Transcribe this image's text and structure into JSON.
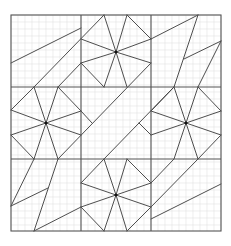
{
  "diagram": {
    "type": "geometric-tessellation-on-grid-paper",
    "frame": {
      "x": 11,
      "y": 15,
      "width": 210,
      "height": 216
    },
    "blocks": {
      "cols": 3,
      "rows": 3,
      "col_lines": [
        81,
        151
      ],
      "row_lines": [
        87,
        159
      ]
    },
    "grid": {
      "minor_step": 7,
      "minor_color": "#e3e3e3",
      "major_color": "#555555",
      "line_color": "#3a3a3a"
    },
    "star_centers": [
      {
        "x": 116,
        "y": 52
      },
      {
        "x": 46,
        "y": 123
      },
      {
        "x": 186,
        "y": 123
      },
      {
        "x": 116,
        "y": 195
      }
    ],
    "segments": [
      [
        11,
        63,
        81,
        28
      ],
      [
        34,
        87,
        104,
        15
      ],
      [
        58,
        87,
        81,
        63
      ],
      [
        81,
        39,
        116,
        52
      ],
      [
        116,
        52,
        151,
        39
      ],
      [
        81,
        63,
        116,
        52
      ],
      [
        116,
        52,
        151,
        63
      ],
      [
        104,
        15,
        116,
        52
      ],
      [
        127,
        15,
        116,
        52
      ],
      [
        104,
        87,
        116,
        52
      ],
      [
        127,
        87,
        116,
        52
      ],
      [
        127,
        15,
        151,
        39
      ],
      [
        81,
        63,
        104,
        87
      ],
      [
        151,
        39,
        198,
        15
      ],
      [
        198,
        15,
        174,
        87
      ],
      [
        184,
        59,
        221,
        41
      ],
      [
        221,
        41,
        198,
        87
      ],
      [
        11,
        110,
        46,
        123
      ],
      [
        11,
        135,
        46,
        123
      ],
      [
        81,
        111,
        46,
        123
      ],
      [
        81,
        135,
        46,
        123
      ],
      [
        34,
        87,
        46,
        123
      ],
      [
        58,
        87,
        46,
        123
      ],
      [
        34,
        159,
        46,
        123
      ],
      [
        58,
        159,
        46,
        123
      ],
      [
        11,
        110,
        34,
        87
      ],
      [
        58,
        87,
        81,
        111
      ],
      [
        11,
        135,
        34,
        159
      ],
      [
        81,
        111,
        92,
        123
      ],
      [
        58,
        159,
        151,
        63
      ],
      [
        104,
        159,
        174,
        87
      ],
      [
        151,
        135,
        139,
        123
      ],
      [
        151,
        111,
        186,
        123
      ],
      [
        151,
        135,
        186,
        123
      ],
      [
        221,
        111,
        186,
        123
      ],
      [
        221,
        135,
        186,
        123
      ],
      [
        174,
        87,
        186,
        123
      ],
      [
        198,
        87,
        186,
        123
      ],
      [
        174,
        159,
        186,
        123
      ],
      [
        198,
        159,
        186,
        123
      ],
      [
        198,
        87,
        221,
        111
      ],
      [
        221,
        135,
        198,
        159
      ],
      [
        151,
        111,
        174,
        87
      ],
      [
        34,
        159,
        11,
        206
      ],
      [
        11,
        206,
        48,
        188
      ],
      [
        58,
        159,
        34,
        231
      ],
      [
        34,
        231,
        81,
        207
      ],
      [
        81,
        183,
        116,
        195
      ],
      [
        81,
        207,
        116,
        195
      ],
      [
        151,
        183,
        116,
        195
      ],
      [
        151,
        207,
        116,
        195
      ],
      [
        104,
        159,
        116,
        195
      ],
      [
        127,
        159,
        116,
        195
      ],
      [
        104,
        231,
        116,
        195
      ],
      [
        127,
        231,
        116,
        195
      ],
      [
        81,
        183,
        104,
        159
      ],
      [
        127,
        159,
        151,
        183
      ],
      [
        81,
        207,
        104,
        231
      ],
      [
        151,
        207,
        127,
        231
      ],
      [
        174,
        159,
        151,
        183
      ],
      [
        198,
        159,
        151,
        207
      ],
      [
        151,
        219,
        221,
        184
      ]
    ]
  }
}
